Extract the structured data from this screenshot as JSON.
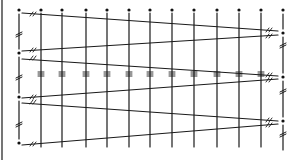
{
  "diagram": {
    "type": "lacing-pattern",
    "width": 299,
    "height": 160,
    "ink_color": "#1a1a1a",
    "background": "#ffffff",
    "border_left_x": 2,
    "grid_top_y": 10,
    "grid_bottom_y": 147,
    "left_post": {
      "x": 19,
      "dots_y": [
        10,
        53,
        97,
        143
      ],
      "break_marks_y": [
        33,
        76,
        123
      ]
    },
    "right_post": {
      "x": 283,
      "dots_y": [
        10,
        33,
        77,
        121
      ],
      "break_marks_y": [
        44,
        90,
        133
      ],
      "bottom_y": 150
    },
    "vertical_lines_x": [
      41,
      62,
      86,
      107,
      129,
      150,
      172,
      194,
      217,
      239,
      261
    ],
    "top_dots_x": [
      41,
      62,
      86,
      107,
      129,
      150,
      172,
      194,
      217,
      239,
      261
    ],
    "middle_tick_row_y": 74,
    "lacing_lines": [
      {
        "x1": 22,
        "y1": 13,
        "x2": 278,
        "y2": 31
      },
      {
        "x1": 22,
        "y1": 51,
        "x2": 278,
        "y2": 35
      },
      {
        "x1": 22,
        "y1": 59,
        "x2": 278,
        "y2": 76
      },
      {
        "x1": 22,
        "y1": 98,
        "x2": 278,
        "y2": 79
      },
      {
        "x1": 22,
        "y1": 103,
        "x2": 278,
        "y2": 121
      },
      {
        "x1": 22,
        "y1": 145,
        "x2": 278,
        "y2": 124
      }
    ],
    "line_end_marks": [
      {
        "x": 32,
        "y": 14
      },
      {
        "x": 32,
        "y": 50
      },
      {
        "x": 32,
        "y": 58
      },
      {
        "x": 32,
        "y": 97
      },
      {
        "x": 32,
        "y": 102
      },
      {
        "x": 32,
        "y": 144
      },
      {
        "x": 268,
        "y": 30
      },
      {
        "x": 268,
        "y": 36
      },
      {
        "x": 268,
        "y": 75
      },
      {
        "x": 268,
        "y": 80
      },
      {
        "x": 268,
        "y": 120
      },
      {
        "x": 268,
        "y": 125
      }
    ]
  }
}
